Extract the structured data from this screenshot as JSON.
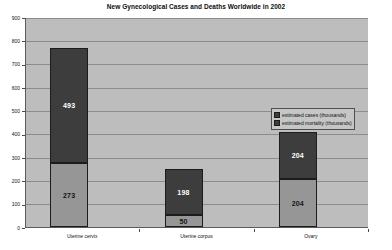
{
  "chart_data": {
    "type": "bar",
    "subtype": "stacked-column",
    "title": "New Gynecological Cases and Deaths Worldwide in 2002",
    "subtitle": "",
    "xlabel": "",
    "ylabel": "",
    "categories": [
      "Uterine cervix",
      "Uterine corpus",
      "Ovary"
    ],
    "series": [
      {
        "name": "estimated mortality (thousands)",
        "values": [
          273,
          50,
          204
        ],
        "color": "#969696",
        "stack_position": "bottom"
      },
      {
        "name": "estimated cases (thousands)",
        "values": [
          493,
          198,
          204
        ],
        "color": "#3d3d3d",
        "stack_position": "top"
      }
    ],
    "totals": [
      766,
      248,
      408
    ],
    "ylim": [
      0,
      900
    ],
    "ytick_step": 100,
    "yticks": [
      0,
      100,
      200,
      300,
      400,
      500,
      600,
      700,
      800,
      900
    ],
    "ytick_labels": [
      "0",
      "100",
      "200",
      "300",
      "400",
      "500",
      "600",
      "700",
      "800",
      "900"
    ],
    "grid": true,
    "grid_axis": "y",
    "legend_position": "right-inside",
    "plot_background": "#bdbdbd",
    "gridline_color": "#8c8c8c",
    "data_labels": [
      {
        "category": "Uterine cervix",
        "cases": "493",
        "mortality": "273"
      },
      {
        "category": "Uterine corpus",
        "cases": "198",
        "mortality": "50"
      },
      {
        "category": "Ovary",
        "cases": "204",
        "mortality": "204"
      }
    ]
  },
  "legend": {
    "items": [
      {
        "label": "estimated cases (thousands)",
        "color": "#3d3d3d"
      },
      {
        "label": "estimated mortality (thousands)",
        "color": "#3d3d3d"
      }
    ]
  }
}
